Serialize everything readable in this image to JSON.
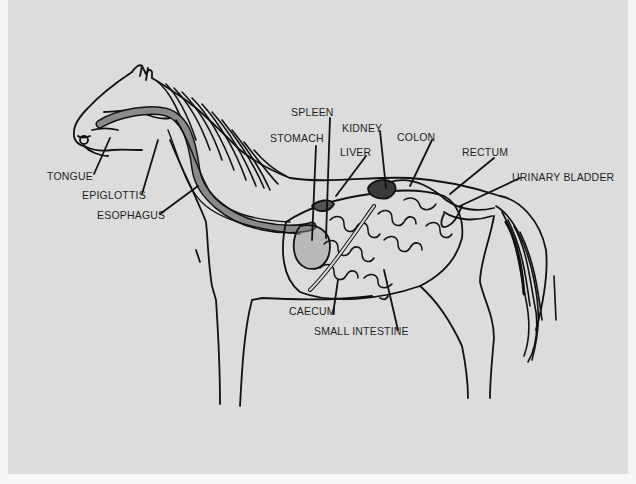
{
  "diagram": {
    "colors": {
      "background": "#dcdcdc",
      "outline": "#111111",
      "esophagus_fill": "#8a8a8a",
      "organ_dark": "#3a3a3a"
    },
    "labels": {
      "tongue": "TONGUE",
      "epiglottis": "EPIGLOTTIS",
      "esophagus": "ESOPHAGUS",
      "spleen": "SPLEEN",
      "stomach": "STOMACH",
      "kidney": "KIDNEY",
      "liver": "LIVER",
      "colon": "COLON",
      "rectum": "RECTUM",
      "urinary_bladder": "URINARY BLADDER",
      "caecum": "CAECUM",
      "small_intestine": "SMALL INTESTINE"
    }
  }
}
